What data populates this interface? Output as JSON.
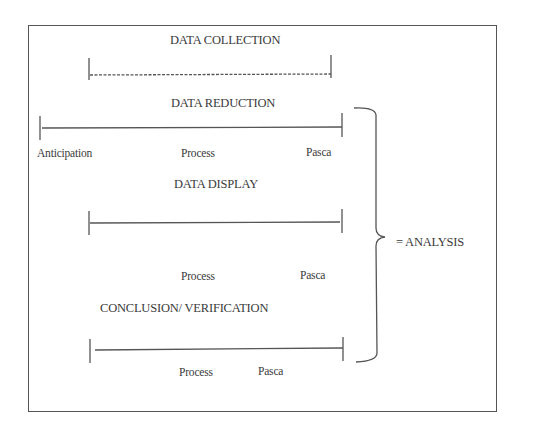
{
  "diagram": {
    "stages": [
      {
        "title": "DATA COLLECTION",
        "line": "dashed",
        "labels": []
      },
      {
        "title": "DATA REDUCTION",
        "line": "solid",
        "labels": [
          "Anticipation",
          "Process",
          "Pasca"
        ]
      },
      {
        "title": "DATA DISPLAY",
        "line": "solid",
        "labels": [
          "Process",
          "Pasca"
        ]
      },
      {
        "title": "CONCLUSION/  VERIFICATION",
        "line": "solid",
        "labels": [
          "Process",
          "Pasca"
        ]
      }
    ],
    "brace_label": "= ANALYSIS"
  }
}
